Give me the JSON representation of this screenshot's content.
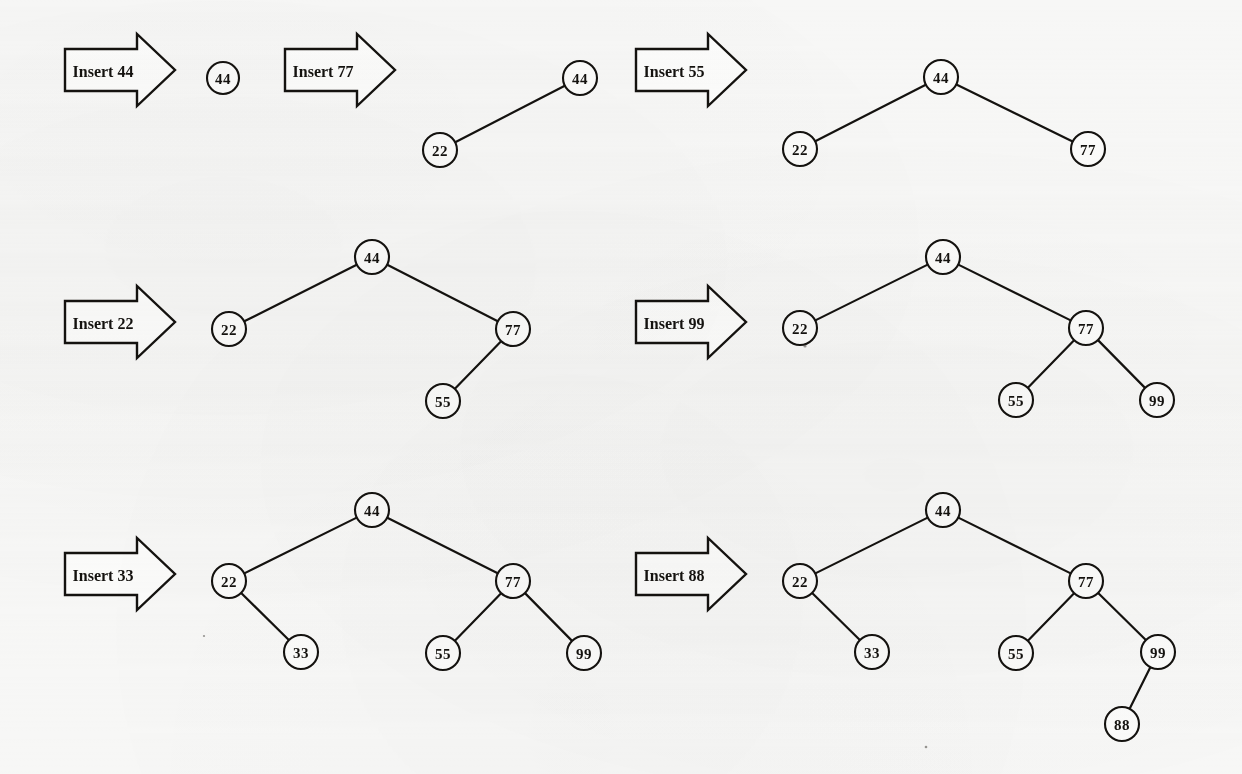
{
  "figure": {
    "background_color": "#f7f7f6",
    "ink_color": "#14120f",
    "node_fill": "#fbfbfa",
    "width": 1242,
    "height": 774
  },
  "steps": [
    {
      "id": "step-insert-44",
      "arrow_label": "Insert 44",
      "inserted_value": "44",
      "arrow": {
        "x": 65,
        "y": 49,
        "body_w": 72,
        "tip_w": 38,
        "body_h": 42,
        "head_h": 72
      },
      "nodes": [
        {
          "id": "n44",
          "label": "44",
          "cx": 223,
          "cy": 78,
          "r": 16
        }
      ],
      "edges": []
    },
    {
      "id": "step-insert-77",
      "arrow_label": "Insert 77",
      "inserted_value": "77",
      "arrow": {
        "x": 285,
        "y": 49,
        "body_w": 72,
        "tip_w": 38,
        "body_h": 42,
        "head_h": 72
      },
      "nodes": [
        {
          "id": "n44",
          "label": "44",
          "cx": 580,
          "cy": 78,
          "r": 17
        },
        {
          "id": "n22",
          "label": "22",
          "cx": 440,
          "cy": 150,
          "r": 17
        }
      ],
      "edges": [
        {
          "from": "n44",
          "to": "n22"
        }
      ]
    },
    {
      "id": "step-insert-55",
      "arrow_label": "Insert 55",
      "inserted_value": "55",
      "arrow": {
        "x": 636,
        "y": 49,
        "body_w": 72,
        "tip_w": 38,
        "body_h": 42,
        "head_h": 72
      },
      "nodes": [
        {
          "id": "n44",
          "label": "44",
          "cx": 941,
          "cy": 77,
          "r": 17
        },
        {
          "id": "n22",
          "label": "22",
          "cx": 800,
          "cy": 149,
          "r": 17
        },
        {
          "id": "n77",
          "label": "77",
          "cx": 1088,
          "cy": 149,
          "r": 17
        }
      ],
      "edges": [
        {
          "from": "n44",
          "to": "n22"
        },
        {
          "from": "n44",
          "to": "n77"
        }
      ]
    },
    {
      "id": "step-insert-22",
      "arrow_label": "Insert 22",
      "inserted_value": "22",
      "arrow": {
        "x": 65,
        "y": 301,
        "body_w": 72,
        "tip_w": 38,
        "body_h": 42,
        "head_h": 72
      },
      "nodes": [
        {
          "id": "n44",
          "label": "44",
          "cx": 372,
          "cy": 257,
          "r": 17
        },
        {
          "id": "n22",
          "label": "22",
          "cx": 229,
          "cy": 329,
          "r": 17
        },
        {
          "id": "n77",
          "label": "77",
          "cx": 513,
          "cy": 329,
          "r": 17
        },
        {
          "id": "n55",
          "label": "55",
          "cx": 443,
          "cy": 401,
          "r": 17
        }
      ],
      "edges": [
        {
          "from": "n44",
          "to": "n22"
        },
        {
          "from": "n44",
          "to": "n77"
        },
        {
          "from": "n77",
          "to": "n55"
        }
      ]
    },
    {
      "id": "step-insert-99",
      "arrow_label": "Insert 99",
      "inserted_value": "99",
      "arrow": {
        "x": 636,
        "y": 301,
        "body_w": 72,
        "tip_w": 38,
        "body_h": 42,
        "head_h": 72
      },
      "nodes": [
        {
          "id": "n44",
          "label": "44",
          "cx": 943,
          "cy": 257,
          "r": 17
        },
        {
          "id": "n22",
          "label": "22",
          "cx": 800,
          "cy": 328,
          "r": 17
        },
        {
          "id": "n77",
          "label": "77",
          "cx": 1086,
          "cy": 328,
          "r": 17
        },
        {
          "id": "n55",
          "label": "55",
          "cx": 1016,
          "cy": 400,
          "r": 17
        },
        {
          "id": "n99",
          "label": "99",
          "cx": 1157,
          "cy": 400,
          "r": 17
        }
      ],
      "edges": [
        {
          "from": "n44",
          "to": "n22"
        },
        {
          "from": "n44",
          "to": "n77"
        },
        {
          "from": "n77",
          "to": "n55"
        },
        {
          "from": "n77",
          "to": "n99"
        }
      ]
    },
    {
      "id": "step-insert-33",
      "arrow_label": "Insert 33",
      "inserted_value": "33",
      "arrow": {
        "x": 65,
        "y": 553,
        "body_w": 72,
        "tip_w": 38,
        "body_h": 42,
        "head_h": 72
      },
      "nodes": [
        {
          "id": "n44",
          "label": "44",
          "cx": 372,
          "cy": 510,
          "r": 17
        },
        {
          "id": "n22",
          "label": "22",
          "cx": 229,
          "cy": 581,
          "r": 17
        },
        {
          "id": "n77",
          "label": "77",
          "cx": 513,
          "cy": 581,
          "r": 17
        },
        {
          "id": "n33",
          "label": "33",
          "cx": 301,
          "cy": 652,
          "r": 17
        },
        {
          "id": "n55",
          "label": "55",
          "cx": 443,
          "cy": 653,
          "r": 17
        },
        {
          "id": "n99",
          "label": "99",
          "cx": 584,
          "cy": 653,
          "r": 17
        }
      ],
      "edges": [
        {
          "from": "n44",
          "to": "n22"
        },
        {
          "from": "n44",
          "to": "n77"
        },
        {
          "from": "n22",
          "to": "n33"
        },
        {
          "from": "n77",
          "to": "n55"
        },
        {
          "from": "n77",
          "to": "n99"
        }
      ]
    },
    {
      "id": "step-insert-88",
      "arrow_label": "Insert 88",
      "inserted_value": "88",
      "arrow": {
        "x": 636,
        "y": 553,
        "body_w": 72,
        "tip_w": 38,
        "body_h": 42,
        "head_h": 72
      },
      "nodes": [
        {
          "id": "n44",
          "label": "44",
          "cx": 943,
          "cy": 510,
          "r": 17
        },
        {
          "id": "n22",
          "label": "22",
          "cx": 800,
          "cy": 581,
          "r": 17
        },
        {
          "id": "n77",
          "label": "77",
          "cx": 1086,
          "cy": 581,
          "r": 17
        },
        {
          "id": "n33",
          "label": "33",
          "cx": 872,
          "cy": 652,
          "r": 17
        },
        {
          "id": "n55",
          "label": "55",
          "cx": 1016,
          "cy": 653,
          "r": 17
        },
        {
          "id": "n99",
          "label": "99",
          "cx": 1158,
          "cy": 652,
          "r": 17
        },
        {
          "id": "n88",
          "label": "88",
          "cx": 1122,
          "cy": 724,
          "r": 17
        }
      ],
      "edges": [
        {
          "from": "n44",
          "to": "n22"
        },
        {
          "from": "n44",
          "to": "n77"
        },
        {
          "from": "n22",
          "to": "n33"
        },
        {
          "from": "n77",
          "to": "n55"
        },
        {
          "from": "n77",
          "to": "n99"
        },
        {
          "from": "n99",
          "to": "n88"
        }
      ]
    }
  ],
  "specks": [
    {
      "cx": 805,
      "cy": 346,
      "r": 1.6
    },
    {
      "cx": 926,
      "cy": 747,
      "r": 1.3
    },
    {
      "cx": 204,
      "cy": 636,
      "r": 1.1
    }
  ]
}
